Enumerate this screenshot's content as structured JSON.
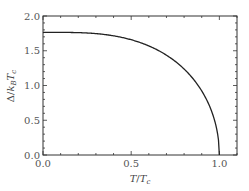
{
  "chart_data": {
    "type": "line",
    "title": "",
    "xlabel": "T/T_c",
    "ylabel": "Δ/k_B T_c",
    "xlim": [
      0.0,
      1.1
    ],
    "ylim": [
      0.0,
      2.0
    ],
    "xticks": [
      "0.0",
      "0.5",
      "1.0"
    ],
    "yticks": [
      "0.0",
      "0.5",
      "1.0",
      "1.5",
      "2.0"
    ],
    "grid": false,
    "legend": null,
    "series": [
      {
        "name": "BCS gap",
        "x": [
          0.0,
          0.1,
          0.2,
          0.3,
          0.4,
          0.5,
          0.6,
          0.65,
          0.7,
          0.75,
          0.8,
          0.85,
          0.9,
          0.95,
          0.98,
          1.0
        ],
        "values": [
          1.76,
          1.76,
          1.76,
          1.75,
          1.72,
          1.67,
          1.59,
          1.53,
          1.46,
          1.37,
          1.26,
          1.12,
          0.94,
          0.67,
          0.43,
          0.0
        ]
      }
    ]
  },
  "labels": {
    "xlabel_main": "T",
    "xlabel_sep": "/",
    "xlabel_den": "T",
    "xlabel_sub": "c",
    "ylabel_text": "Δ/k_BT_c"
  }
}
